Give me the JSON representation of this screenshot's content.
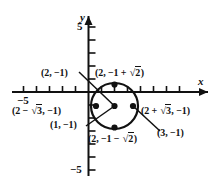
{
  "figure": {
    "kind": "coordinate-plane-with-circle",
    "axes": {
      "x_label": "x",
      "y_label": "y",
      "x_tick_label_left": "−5",
      "y_tick_label_top": "5",
      "y_tick_label_bottom": "−5",
      "x_range": [
        -6,
        9
      ],
      "y_range": [
        -6.5,
        6
      ],
      "tick_spacing": 1,
      "origin_px": [
        88.5,
        92.0
      ],
      "unit_px": 13.0
    },
    "circle": {
      "center_x": 2,
      "center_y": -1,
      "radius_x_value": 1.732,
      "radius_y_value": 1.414,
      "center_px": [
        114.5,
        106.0
      ],
      "radius_px": [
        23.5,
        23.0
      ],
      "stroke": "#111111",
      "stroke_width": 2.1
    },
    "points": [
      {
        "id": "center",
        "label": "(2, −1)",
        "px": [
          114.5,
          106.0
        ]
      },
      {
        "id": "left",
        "label": "(2 − √3, −1)",
        "px": [
          96.0,
          106.0
        ]
      },
      {
        "id": "right",
        "label": "(2 + √3, −1)",
        "px": [
          133.0,
          106.0
        ]
      },
      {
        "id": "top",
        "label": "(2, −1 + √2)",
        "px": [
          114.5,
          84.5
        ]
      },
      {
        "id": "bottom",
        "label": "(2, −1 − √2)",
        "px": [
          114.5,
          127.5
        ]
      }
    ],
    "labels": {
      "center": {
        "pre": "(2, −1)"
      },
      "top": {
        "pre": "(2, −1 + ",
        "radicand": "2",
        "post": ")"
      },
      "bottom": {
        "pre": "(2, −1 − ",
        "radicand": "2",
        "post": ")"
      },
      "left": {
        "pre": "(2 − ",
        "radicand": "3",
        "post": ", −1)"
      },
      "right": {
        "pre": "(2 + ",
        "radicand": "3",
        "post": ", −1)"
      },
      "left_endpoint": {
        "pre": "(1, −1)"
      },
      "right_endpoint": {
        "pre": "(3, −1)"
      }
    },
    "colors": {
      "ink": "#111111",
      "background": "#ffffff"
    }
  }
}
